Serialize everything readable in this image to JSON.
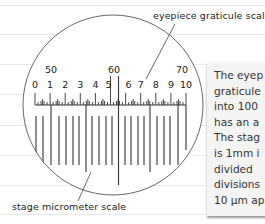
{
  "labels": {
    "graticule": "eyepiece graticule scale",
    "stage": "stage micrometer scale"
  },
  "graticule_scale": {
    "upper_numbers": [
      "50",
      "60",
      "70"
    ],
    "lower_numbers": [
      "0",
      "1",
      "2",
      "3",
      "4",
      "5",
      "6",
      "7",
      "8",
      "9",
      "10"
    ]
  },
  "note": {
    "lines": [
      "The eyep",
      "graticule",
      "into 100",
      "has an a",
      "The stag",
      "is 1mm i",
      "divided",
      "divisions",
      "10 µm ap"
    ]
  },
  "colors": {
    "ink": "#222222",
    "rule_line": "#e6e6e6",
    "note_bg": "#f4f4f3"
  }
}
